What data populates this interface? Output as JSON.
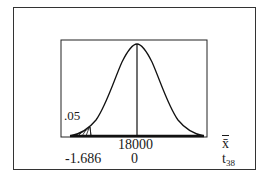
{
  "figure": {
    "type": "t-distribution hypothesis test diagram",
    "tail": "left",
    "shaded_area_label": ".05",
    "xbar_axis": {
      "label": "x̄",
      "center_value": "18000"
    },
    "t_axis": {
      "label": "t",
      "df_subscript": "38",
      "critical_value": "-1.686",
      "center_value": "0"
    }
  },
  "colors": {
    "line": "#1a1a1a",
    "background": "#ffffff"
  }
}
